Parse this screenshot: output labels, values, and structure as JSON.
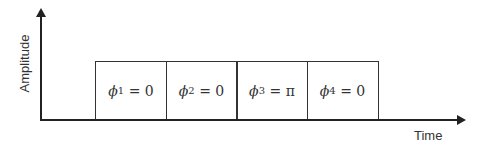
{
  "axes": {
    "y_label": "Amplitude",
    "x_label": "Time"
  },
  "boxes": [
    {
      "symbol": "ϕ",
      "index": "1",
      "eq": " = 0"
    },
    {
      "symbol": "ϕ",
      "index": "2",
      "eq": " = 0"
    },
    {
      "symbol": "ϕ",
      "index": "3",
      "eq": " = π"
    },
    {
      "symbol": "ϕ",
      "index": "4",
      "eq": " = 0"
    }
  ]
}
